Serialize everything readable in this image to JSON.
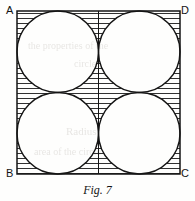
{
  "figure": {
    "caption": "Fig. 7",
    "vertices": {
      "top_left": "A",
      "top_right": "D",
      "bottom_left": "B",
      "bottom_right": "C"
    },
    "colors": {
      "ink": "#141414",
      "paper": "#fefefd",
      "hatch": "#1a1a1a",
      "bleed": "#b9b4ae"
    },
    "square": {
      "x": 17,
      "y": 11,
      "size": 163
    },
    "circles": [
      {
        "cx": 57.75,
        "cy": 51.75,
        "r": 40.75,
        "quadrant": "top-left"
      },
      {
        "cx": 139.25,
        "cy": 51.75,
        "r": 40.75,
        "quadrant": "top-right"
      },
      {
        "cx": 57.75,
        "cy": 133.25,
        "r": 40.75,
        "quadrant": "bottom-left"
      },
      {
        "cx": 139.25,
        "cy": 133.25,
        "r": 40.75,
        "quadrant": "bottom-right"
      }
    ],
    "center_line": {
      "x": 98.5,
      "y1": 11,
      "y2": 174
    },
    "hatching": {
      "orientation": "horizontal",
      "spacing": 5,
      "stroke_width": 0.9
    },
    "bleed_through": [
      {
        "text": "the properties of the",
        "x": 28,
        "y": 40,
        "size": 10
      },
      {
        "text": "circles",
        "x": 74,
        "y": 58,
        "size": 10
      },
      {
        "text": "Radius",
        "x": 66,
        "y": 125,
        "size": 11
      },
      {
        "text": "area of the circle",
        "x": 34,
        "y": 146,
        "size": 10
      }
    ]
  }
}
